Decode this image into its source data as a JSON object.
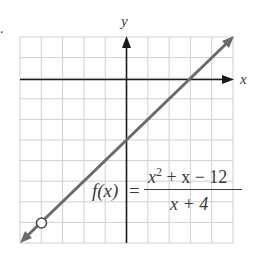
{
  "problem_marker": ".",
  "chart_data": {
    "type": "line",
    "title": "",
    "xlabel": "x",
    "ylabel": "y",
    "xlim": [
      -5,
      5
    ],
    "ylim": [
      -8,
      2
    ],
    "grid": true,
    "grid_step": 1,
    "tick_labels_shown": false,
    "series": [
      {
        "name": "f(x) = (x^2 + x - 12)/(x + 4)",
        "equivalent_line": "y = x - 3",
        "x": [
          -5,
          5
        ],
        "y": [
          -8,
          2
        ],
        "arrows_at_ends": true,
        "color": "#6b6b6b"
      }
    ],
    "annotations": [
      {
        "type": "open-circle",
        "label": "hole",
        "x": -4,
        "y": -7
      },
      {
        "type": "function-label",
        "text": "f(x) = (x² + x − 12)/(x + 4)"
      }
    ],
    "intercepts": {
      "x_intercept": 3,
      "y_intercept": -3
    }
  },
  "labels": {
    "x_axis": "x",
    "y_axis": "y",
    "function_name": "f(x)",
    "equals": "=",
    "numerator_base": "x",
    "numerator_exp": "2",
    "numerator_rest": " + x − 12",
    "denominator": "x + 4"
  },
  "colors": {
    "grid": "#cfcfcf",
    "axis": "#1a1a1a",
    "curve": "#6b6b6b",
    "text": "#3a3a3a",
    "background": "#ffffff"
  }
}
